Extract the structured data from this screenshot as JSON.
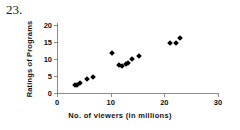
{
  "figure": {
    "problem_number": "23."
  },
  "chart_data": {
    "type": "scatter",
    "title": "",
    "xlabel": "No. of viewers (in millions)",
    "ylabel": "Ratings of Programs",
    "xlim": [
      0,
      30
    ],
    "ylim": [
      0,
      20
    ],
    "xticks": [
      0,
      10,
      20,
      30
    ],
    "xtick_labels": [
      "0",
      "10",
      "20",
      "30"
    ],
    "yticks": [
      0,
      5,
      10,
      15,
      20
    ],
    "ytick_labels": [
      "0",
      "5",
      "10",
      "15",
      "20"
    ],
    "grid": false,
    "legend": false,
    "marker": "diamond",
    "marker_color": "#000000",
    "points": [
      {
        "x": 3.4,
        "y": 2.3
      },
      {
        "x": 3.8,
        "y": 2.5
      },
      {
        "x": 4.2,
        "y": 2.8
      },
      {
        "x": 5.5,
        "y": 4.0
      },
      {
        "x": 6.8,
        "y": 4.8
      },
      {
        "x": 10.3,
        "y": 11.7
      },
      {
        "x": 11.5,
        "y": 8.2
      },
      {
        "x": 12.1,
        "y": 8.0
      },
      {
        "x": 12.8,
        "y": 8.5
      },
      {
        "x": 13.3,
        "y": 8.8
      },
      {
        "x": 14.0,
        "y": 10.0
      },
      {
        "x": 15.2,
        "y": 10.8
      },
      {
        "x": 21.0,
        "y": 14.6
      },
      {
        "x": 22.1,
        "y": 14.8
      },
      {
        "x": 23.0,
        "y": 16.2
      }
    ]
  }
}
